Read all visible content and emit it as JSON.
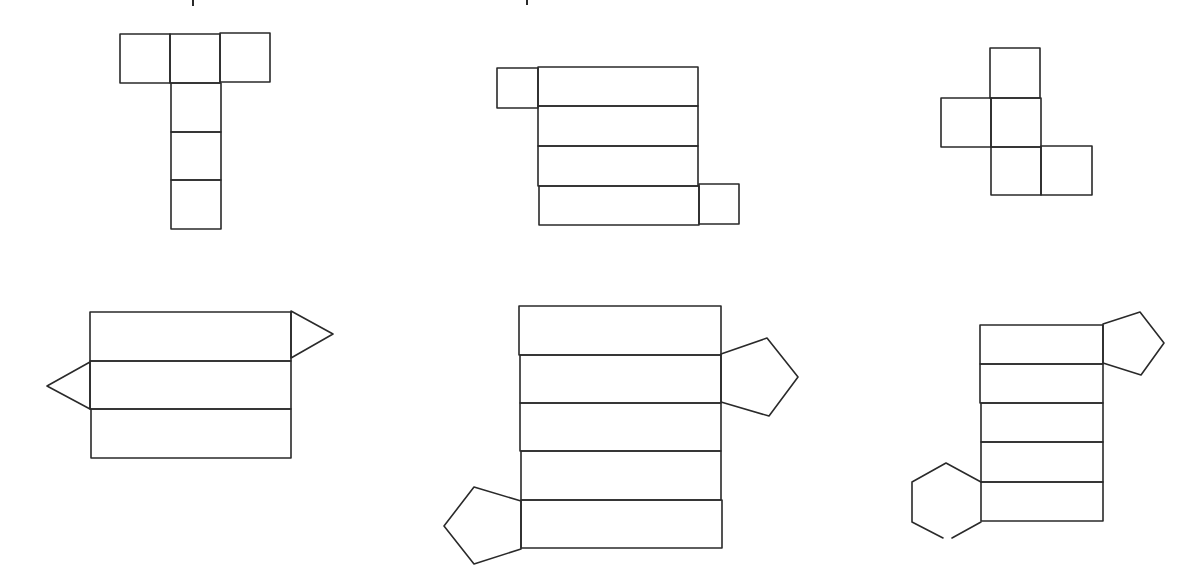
{
  "header_text_visible": "",
  "stroke_color": "#2a2a2a",
  "background_color": "#ffffff",
  "figures": [
    {
      "id": "net-1",
      "description": "Cube net, T-shape: row of three squares with a column of three squares below the middle",
      "faces": 6,
      "face_shape": "square"
    },
    {
      "id": "net-2",
      "description": "Rectangular prism net: four stacked rectangles with a square end tab at top-left and bottom-right",
      "faces": 6,
      "face_shape": "rectangle"
    },
    {
      "id": "net-3",
      "description": "Cube-like arrangement of five squares (incomplete net)",
      "faces": 5,
      "face_shape": "square"
    },
    {
      "id": "net-4",
      "description": "Triangular prism net: three stacked rectangles with triangle ends on right and left",
      "faces": 5,
      "face_shape": "rectangle+triangle"
    },
    {
      "id": "net-5",
      "description": "Pentagonal prism net: five stacked rectangles with pentagon ends on right and bottom-left",
      "faces": 7,
      "face_shape": "rectangle+pentagon"
    },
    {
      "id": "net-6",
      "description": "Prism net: five stacked rectangles with a pentagon at top-right and a hexagon at bottom-left (mismatched bases)",
      "faces": 7,
      "face_shape": "rectangle+pentagon+hexagon"
    }
  ]
}
